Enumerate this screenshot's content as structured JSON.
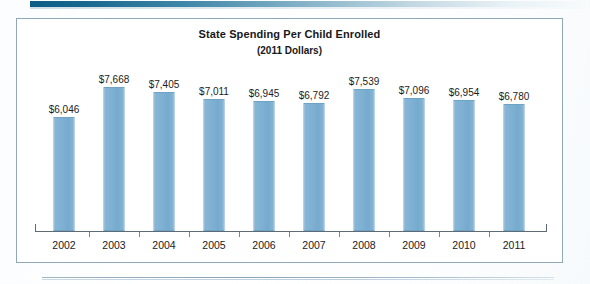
{
  "chart_data": {
    "type": "bar",
    "title": "State Spending Per Child Enrolled",
    "subtitle": "(2011 Dollars)",
    "xlabel": "",
    "ylabel": "",
    "categories": [
      "2002",
      "2003",
      "2004",
      "2005",
      "2006",
      "2007",
      "2008",
      "2009",
      "2010",
      "2011"
    ],
    "values": [
      6046,
      7668,
      7405,
      7011,
      6945,
      6792,
      7539,
      7096,
      6954,
      6780
    ],
    "data_labels": [
      "$6,046",
      "$7,668",
      "$7,405",
      "$7,011",
      "$6,945",
      "$6,792",
      "$7,539",
      "$7,096",
      "$6,954",
      "$6,780"
    ],
    "ylim": [
      0,
      8200
    ],
    "grid": false,
    "legend": false,
    "bar_color": "#7fb1d3",
    "bar_border_color": "#6ea3c8",
    "axis_color": "#5f6b74"
  },
  "frame": {
    "border_color": "#8fa8bc"
  },
  "decor": {
    "top_band_color": "#0d5c86",
    "rule_color": "#8aa4b7"
  }
}
